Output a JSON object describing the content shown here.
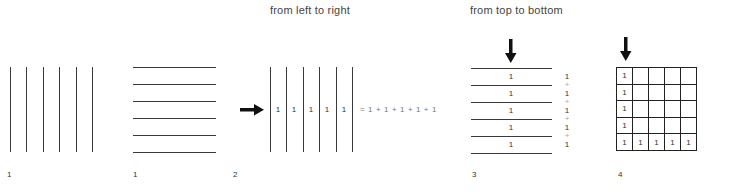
{
  "titles": {
    "left_to_right": "from left to right",
    "top_to_bottom": "from top to bottom"
  },
  "figure_labels": {
    "fig1a": "1",
    "fig1b": "1",
    "fig2": "2",
    "fig3": "3",
    "fig4": "4"
  },
  "figure2": {
    "cell_values": [
      "1",
      "1",
      "1",
      "1",
      "1"
    ],
    "equation": "= 1 + 1 + 1 + 1 + 1",
    "arrow": "arrow-right-icon"
  },
  "figure3": {
    "row_values": [
      "1",
      "1",
      "1",
      "1",
      "1"
    ],
    "sum_column": [
      "1",
      "+",
      "1",
      "+",
      "1",
      "+",
      "1",
      "+",
      "1"
    ],
    "arrow": "arrow-down-icon"
  },
  "figure4": {
    "grid_rows": [
      [
        "1",
        "",
        "",
        "",
        ""
      ],
      [
        "1",
        "",
        "",
        "",
        ""
      ],
      [
        "1",
        "",
        "",
        "",
        ""
      ],
      [
        "1",
        "",
        "",
        "",
        ""
      ],
      [
        "1",
        "1",
        "1",
        "1",
        "1"
      ]
    ],
    "arrow": "arrow-down-icon"
  },
  "colors": {
    "line": "#3a3a3a",
    "text": "#333333",
    "plus": "#aaaaaa",
    "background": "#ffffff"
  }
}
